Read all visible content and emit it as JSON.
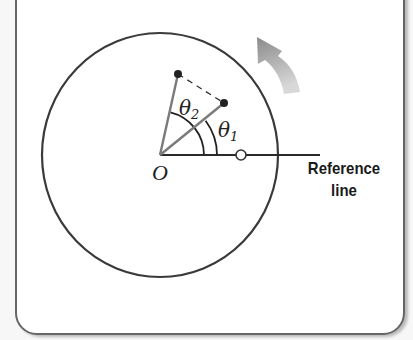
{
  "diagram": {
    "type": "rotational-kinematics",
    "labels": {
      "origin": "O",
      "theta1": "θ",
      "theta1_sub": "1",
      "theta2": "θ",
      "theta2_sub": "2",
      "reference_line_line1": "Reference",
      "reference_line_line2": "line"
    },
    "geometry": {
      "origin": [
        160,
        155
      ],
      "disk": {
        "cx": 160,
        "cy": 155,
        "rx": 118,
        "ry": 122
      },
      "reference_line_end": [
        320,
        155
      ],
      "reference_marker": [
        241,
        155
      ],
      "point1": [
        224,
        103
      ],
      "point2": [
        178,
        74
      ],
      "arc_theta1_radius": 57,
      "arc_theta2_radius": 44
    },
    "rotation_direction": "counterclockwise",
    "colors": {
      "outline": "#3a3a3a",
      "radius_lines": "#7a7a7a",
      "arrow": "#9a9a9a",
      "text": "#1a1a1a"
    }
  }
}
